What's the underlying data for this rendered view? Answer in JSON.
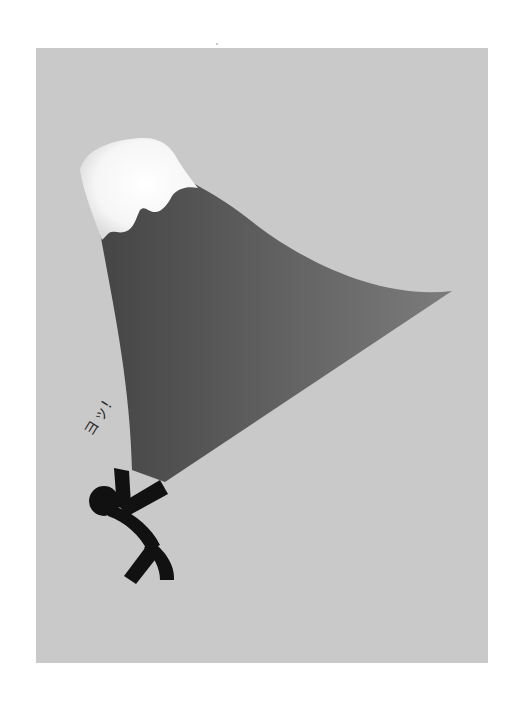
{
  "illustration": {
    "subject": "Stick figure holding up a tilted Mt. Fuji-like mountain",
    "shout_text": "ヨッ!",
    "colors": {
      "page_background": "#ffffff",
      "panel_background": "#c9c9c9",
      "mountain_dark": "#4a4a4a",
      "mountain_light": "#7a7a7a",
      "snow": "#ffffff",
      "figure": "#111111",
      "text": "#2a2a2a"
    }
  }
}
